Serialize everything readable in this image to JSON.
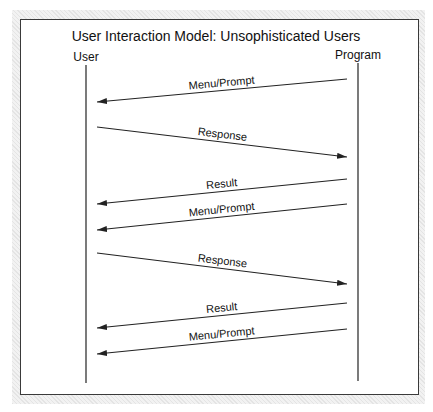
{
  "diagram": {
    "title": "User Interaction Model: Unsophisticated Users",
    "actors": [
      {
        "label": "User",
        "x": 86
      },
      {
        "label": "Program",
        "x": 358
      }
    ],
    "messages": [
      {
        "label": "Menu/Prompt",
        "from": "Program",
        "to": "User",
        "y_from": 79,
        "y_to": 102
      },
      {
        "label": "Response",
        "from": "User",
        "to": "Program",
        "y_from": 127,
        "y_to": 157
      },
      {
        "label": "Result",
        "from": "Program",
        "to": "User",
        "y_from": 179,
        "y_to": 204
      },
      {
        "label": "Menu/Prompt",
        "from": "Program",
        "to": "User",
        "y_from": 204,
        "y_to": 230
      },
      {
        "label": "Response",
        "from": "User",
        "to": "Program",
        "y_from": 253,
        "y_to": 284
      },
      {
        "label": "Result",
        "from": "Program",
        "to": "User",
        "y_from": 303,
        "y_to": 328
      },
      {
        "label": "Menu/Prompt",
        "from": "Program",
        "to": "User",
        "y_from": 329,
        "y_to": 354
      }
    ],
    "colors": {
      "line": "#222222",
      "frame": "#3a3a3a",
      "shade": "#ececec"
    }
  }
}
